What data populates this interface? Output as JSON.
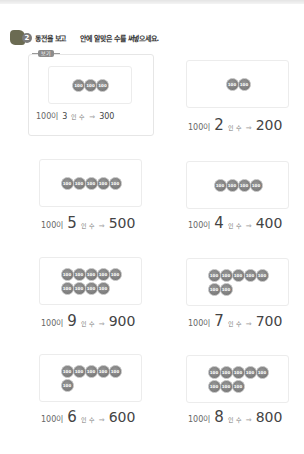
{
  "header": {
    "problem_number": "2",
    "instruction_part1": "동전을 보고",
    "instruction_part2": "안에 알맞은 수를 써넣으세요."
  },
  "example": {
    "tag_label": "보기",
    "coin_label": "100",
    "coins": 3,
    "base": "100이",
    "count": "3",
    "unit": "인 수",
    "arrow": "⇒",
    "total": "300"
  },
  "problems": [
    {
      "coins": 2,
      "base": "100이",
      "count": "2",
      "unit": "인 수",
      "arrow": "⇒",
      "total": "200"
    },
    {
      "coins": 5,
      "base": "100이",
      "count": "5",
      "unit": "인 수",
      "arrow": "⇒",
      "total": "500"
    },
    {
      "coins": 4,
      "base": "100이",
      "count": "4",
      "unit": "인 수",
      "arrow": "⇒",
      "total": "400"
    },
    {
      "coins": 9,
      "base": "100이",
      "count": "9",
      "unit": "인 수",
      "arrow": "⇒",
      "total": "900"
    },
    {
      "coins": 7,
      "base": "100이",
      "count": "7",
      "unit": "인 수",
      "arrow": "⇒",
      "total": "700"
    },
    {
      "coins": 6,
      "base": "100이",
      "count": "6",
      "unit": "인 수",
      "arrow": "⇒",
      "total": "600"
    },
    {
      "coins": 8,
      "base": "100이",
      "count": "8",
      "unit": "인 수",
      "arrow": "⇒",
      "total": "800"
    }
  ]
}
